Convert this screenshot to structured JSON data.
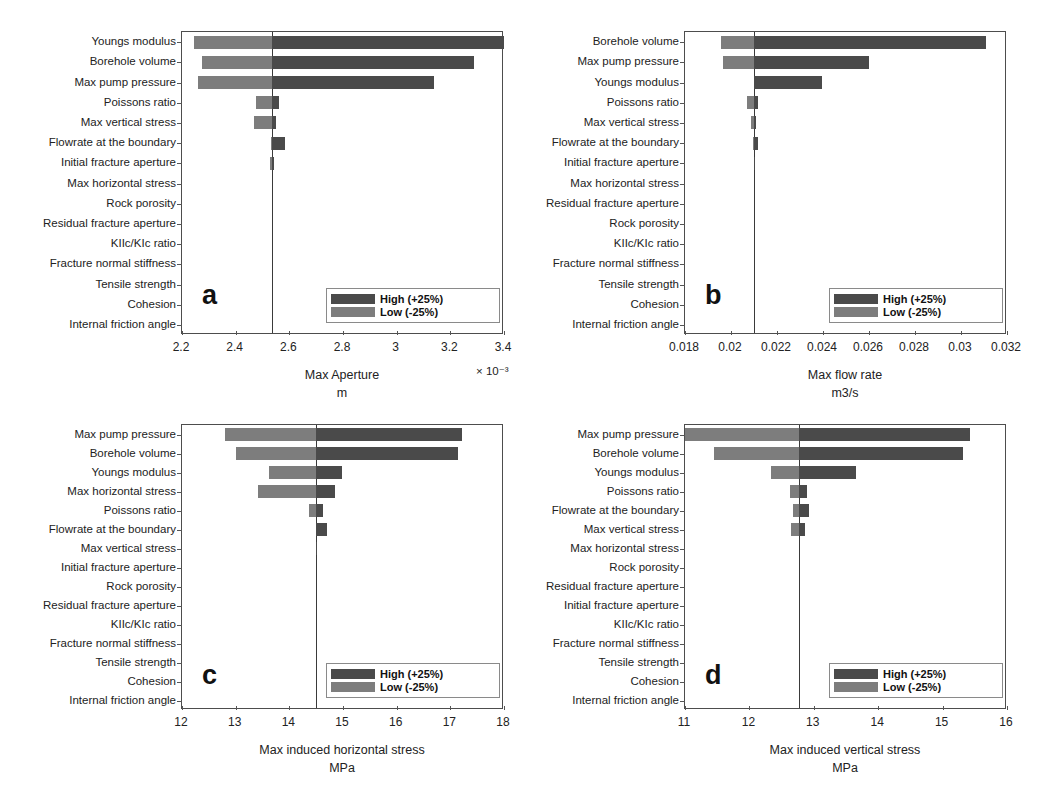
{
  "figure": {
    "width": 1037,
    "height": 808,
    "background": "#ffffff",
    "colors": {
      "high": "#4a4a4a",
      "low": "#7d7d7d",
      "axis": "#4d4d4d",
      "baseline": "#3a3a3a"
    }
  },
  "legend": {
    "high_label": "High (+25%)",
    "low_label": "Low (-25%)"
  },
  "chart_data": [
    {
      "id": "a",
      "panel_letter": "a",
      "type": "bar",
      "orientation": "horizontal",
      "subtype": "tornado",
      "title": "",
      "xlabel": "Max Aperture",
      "xunit": "m",
      "exponent": "× 10⁻³",
      "ylabel": "",
      "xlim": [
        2.2,
        3.4
      ],
      "xticks": [
        2.2,
        2.4,
        2.6,
        2.8,
        3.0,
        3.2,
        3.4
      ],
      "xticklabels": [
        "2.2",
        "2.4",
        "2.6",
        "2.8",
        "3",
        "3.2",
        "3.4"
      ],
      "baseline": 2.535,
      "grid": false,
      "legend_position": "lower right",
      "categories": [
        "Youngs modulus",
        "Borehole volume",
        "Max pump pressure",
        "Poissons ratio",
        "Max vertical stress",
        "Flowrate at the boundary",
        "Initial fracture aperture",
        "Max horizontal stress",
        "Rock porosity",
        "Residual fracture aperture",
        "KIIc/KIc ratio",
        "Fracture normal stiffness",
        "Tensile strength",
        "Cohesion",
        "Internal friction angle"
      ],
      "series": [
        {
          "name": "Low (-25%)",
          "values": [
            2.245,
            2.275,
            2.26,
            2.475,
            2.47,
            2.53,
            2.528,
            2.535,
            2.535,
            2.535,
            2.535,
            2.535,
            2.535,
            2.535,
            2.535
          ]
        },
        {
          "name": "High (+25%)",
          "values": [
            3.4,
            3.29,
            3.14,
            2.562,
            2.552,
            2.585,
            2.541,
            2.535,
            2.535,
            2.535,
            2.535,
            2.535,
            2.535,
            2.535,
            2.535
          ]
        }
      ]
    },
    {
      "id": "b",
      "panel_letter": "b",
      "type": "bar",
      "orientation": "horizontal",
      "subtype": "tornado",
      "title": "",
      "xlabel": "Max flow rate",
      "xunit": "m3/s",
      "exponent": "",
      "ylabel": "",
      "xlim": [
        0.018,
        0.032
      ],
      "xticks": [
        0.018,
        0.02,
        0.022,
        0.024,
        0.026,
        0.028,
        0.03,
        0.032
      ],
      "xticklabels": [
        "0.018",
        "0.02",
        "0.022",
        "0.024",
        "0.026",
        "0.028",
        "0.03",
        "0.032"
      ],
      "baseline": 0.021,
      "grid": false,
      "legend_position": "lower right",
      "categories": [
        "Borehole volume",
        "Max pump pressure",
        "Youngs modulus",
        "Poissons ratio",
        "Max vertical stress",
        "Flowrate at the boundary",
        "Initial fracture aperture",
        "Max horizontal stress",
        "Residual fracture aperture",
        "Rock porosity",
        "KIIc/KIc ratio",
        "Fracture normal stiffness",
        "Tensile strength",
        "Cohesion",
        "Internal friction angle"
      ],
      "series": [
        {
          "name": "Low (-25%)",
          "values": [
            0.01955,
            0.01965,
            0.021,
            0.0207,
            0.02085,
            0.02095,
            0.02098,
            0.021,
            0.021,
            0.021,
            0.021,
            0.021,
            0.021,
            0.021,
            0.021
          ]
        },
        {
          "name": "High (+25%)",
          "values": [
            0.0311,
            0.026,
            0.02395,
            0.02118,
            0.0211,
            0.02118,
            0.02102,
            0.021,
            0.021,
            0.021,
            0.021,
            0.021,
            0.021,
            0.021,
            0.021
          ]
        }
      ]
    },
    {
      "id": "c",
      "panel_letter": "c",
      "type": "bar",
      "orientation": "horizontal",
      "subtype": "tornado",
      "title": "",
      "xlabel": "Max induced horizontal stress",
      "xunit": "MPa",
      "exponent": "",
      "ylabel": "",
      "xlim": [
        12,
        18
      ],
      "xticks": [
        12,
        13,
        14,
        15,
        16,
        17,
        18
      ],
      "xticklabels": [
        "12",
        "13",
        "14",
        "15",
        "16",
        "17",
        "18"
      ],
      "baseline": 14.5,
      "grid": false,
      "legend_position": "lower right",
      "categories": [
        "Max pump pressure",
        "Borehole volume",
        "Youngs modulus",
        "Max horizontal stress",
        "Poissons ratio",
        "Flowrate at the boundary",
        "Max vertical stress",
        "Initial fracture aperture",
        "Rock porosity",
        "Residual fracture aperture",
        "KIIc/KIc ratio",
        "Fracture normal stiffness",
        "Tensile strength",
        "Cohesion",
        "Internal friction angle"
      ],
      "series": [
        {
          "name": "Low (-25%)",
          "values": [
            12.8,
            13.0,
            13.62,
            13.42,
            14.37,
            14.5,
            14.49,
            14.5,
            14.5,
            14.5,
            14.5,
            14.5,
            14.5,
            14.5,
            14.5
          ]
        },
        {
          "name": "High (+25%)",
          "values": [
            17.22,
            17.15,
            14.98,
            14.85,
            14.62,
            14.7,
            14.52,
            14.5,
            14.5,
            14.5,
            14.5,
            14.5,
            14.5,
            14.5,
            14.5
          ]
        }
      ]
    },
    {
      "id": "d",
      "panel_letter": "d",
      "type": "bar",
      "orientation": "horizontal",
      "subtype": "tornado",
      "title": "",
      "xlabel": "Max induced vertical stress",
      "xunit": "MPa",
      "exponent": "",
      "ylabel": "",
      "xlim": [
        11,
        16
      ],
      "xticks": [
        11,
        12,
        13,
        14,
        15,
        16
      ],
      "xticklabels": [
        "11",
        "12",
        "13",
        "14",
        "15",
        "16"
      ],
      "baseline": 12.77,
      "grid": false,
      "legend_position": "lower right",
      "categories": [
        "Max pump pressure",
        "Borehole volume",
        "Youngs modulus",
        "Poissons ratio",
        "Flowrate at the boundary",
        "Max vertical stress",
        "Max horizontal stress",
        "Rock porosity",
        "Residual fracture aperture",
        "Initial fracture aperture",
        "KIIc/KIc ratio",
        "Fracture normal stiffness",
        "Tensile strength",
        "Cohesion",
        "Internal friction angle"
      ],
      "series": [
        {
          "name": "Low (-25%)",
          "values": [
            11.0,
            11.45,
            12.33,
            12.63,
            12.67,
            12.65,
            12.77,
            12.77,
            12.77,
            12.77,
            12.77,
            12.77,
            12.77,
            12.77,
            12.77
          ]
        },
        {
          "name": "High (+25%)",
          "values": [
            15.43,
            15.32,
            13.65,
            12.89,
            12.92,
            12.86,
            12.77,
            12.77,
            12.77,
            12.77,
            12.77,
            12.77,
            12.77,
            12.77,
            12.77
          ]
        }
      ]
    }
  ]
}
